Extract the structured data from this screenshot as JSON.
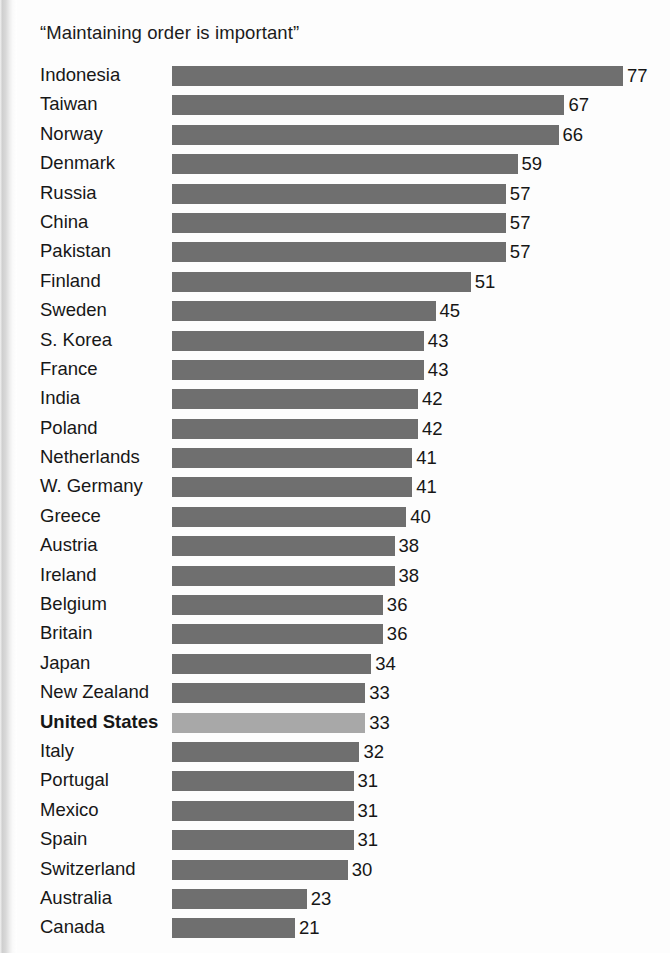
{
  "chart_data": {
    "type": "bar",
    "title": "“Maintaining order is important”",
    "orientation": "horizontal",
    "xlabel": "",
    "ylabel": "",
    "xlim": [
      0,
      77
    ],
    "grid": false,
    "legend": "none",
    "value_label_position": "outside-end",
    "highlight_category": "United States",
    "categories": [
      "Indonesia",
      "Taiwan",
      "Norway",
      "Denmark",
      "Russia",
      "China",
      "Pakistan",
      "Finland",
      "Sweden",
      "S. Korea",
      "France",
      "India",
      "Poland",
      "Netherlands",
      "W. Germany",
      "Greece",
      "Austria",
      "Ireland",
      "Belgium",
      "Britain",
      "Japan",
      "New Zealand",
      "United States",
      "Italy",
      "Portugal",
      "Mexico",
      "Spain",
      "Switzerland",
      "Australia",
      "Canada"
    ],
    "values": [
      77,
      67,
      66,
      59,
      57,
      57,
      57,
      51,
      45,
      43,
      43,
      42,
      42,
      41,
      41,
      40,
      38,
      38,
      36,
      36,
      34,
      33,
      33,
      32,
      31,
      31,
      31,
      30,
      23,
      21
    ],
    "bars": [
      {
        "label": "Indonesia",
        "value": 77,
        "value_text": "77",
        "highlight": false
      },
      {
        "label": "Taiwan",
        "value": 67,
        "value_text": "67",
        "highlight": false
      },
      {
        "label": "Norway",
        "value": 66,
        "value_text": "66",
        "highlight": false
      },
      {
        "label": "Denmark",
        "value": 59,
        "value_text": "59",
        "highlight": false
      },
      {
        "label": "Russia",
        "value": 57,
        "value_text": "57",
        "highlight": false
      },
      {
        "label": "China",
        "value": 57,
        "value_text": "57",
        "highlight": false
      },
      {
        "label": "Pakistan",
        "value": 57,
        "value_text": "57",
        "highlight": false
      },
      {
        "label": "Finland",
        "value": 51,
        "value_text": "51",
        "highlight": false
      },
      {
        "label": "Sweden",
        "value": 45,
        "value_text": "45",
        "highlight": false
      },
      {
        "label": "S. Korea",
        "value": 43,
        "value_text": "43",
        "highlight": false
      },
      {
        "label": "France",
        "value": 43,
        "value_text": "43",
        "highlight": false
      },
      {
        "label": "India",
        "value": 42,
        "value_text": "42",
        "highlight": false
      },
      {
        "label": "Poland",
        "value": 42,
        "value_text": "42",
        "highlight": false
      },
      {
        "label": "Netherlands",
        "value": 41,
        "value_text": "41",
        "highlight": false
      },
      {
        "label": "W. Germany",
        "value": 41,
        "value_text": "41",
        "highlight": false
      },
      {
        "label": "Greece",
        "value": 40,
        "value_text": "40",
        "highlight": false
      },
      {
        "label": "Austria",
        "value": 38,
        "value_text": "38",
        "highlight": false
      },
      {
        "label": "Ireland",
        "value": 38,
        "value_text": "38",
        "highlight": false
      },
      {
        "label": "Belgium",
        "value": 36,
        "value_text": "36",
        "highlight": false
      },
      {
        "label": "Britain",
        "value": 36,
        "value_text": "36",
        "highlight": false
      },
      {
        "label": "Japan",
        "value": 34,
        "value_text": "34",
        "highlight": false
      },
      {
        "label": "New Zealand",
        "value": 33,
        "value_text": "33",
        "highlight": false
      },
      {
        "label": "United States",
        "value": 33,
        "value_text": "33",
        "highlight": true
      },
      {
        "label": "Italy",
        "value": 32,
        "value_text": "32",
        "highlight": false
      },
      {
        "label": "Portugal",
        "value": 31,
        "value_text": "31",
        "highlight": false
      },
      {
        "label": "Mexico",
        "value": 31,
        "value_text": "31",
        "highlight": false
      },
      {
        "label": "Spain",
        "value": 31,
        "value_text": "31",
        "highlight": false
      },
      {
        "label": "Switzerland",
        "value": 30,
        "value_text": "30",
        "highlight": false
      },
      {
        "label": "Australia",
        "value": 23,
        "value_text": "23",
        "highlight": false
      },
      {
        "label": "Canada",
        "value": 21,
        "value_text": "21",
        "highlight": false
      }
    ],
    "colors": {
      "bar": "#6f6f6f",
      "bar_highlight": "#a8a8a8",
      "text": "#171717",
      "background": "#fdfdfd"
    }
  }
}
